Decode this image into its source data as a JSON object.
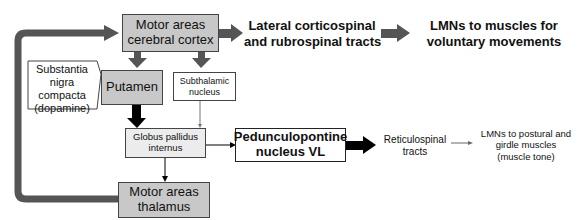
{
  "diagram": {
    "nodes": {
      "cortex": "Motor areas\ncerebral cortex",
      "lateral_tracts": "Lateral corticospinal\nand rubrospinal tracts",
      "lmn_voluntary": "LMNs to muscles for\nvoluntary movements",
      "substantia_nigra": "Substantia\nnigra\ncompacta\n(dopamine)",
      "putamen": "Putamen",
      "subthalamic": "Subthalamic\nnucleus",
      "globus_pallidus": "Globus pallidus\ninternus",
      "pedunculopontine": "Pedunculopontine\nnucleus VL",
      "reticulospinal": "Reticulospinal\ntracts",
      "lmn_postural": "LMNs to postural and\ngirdle muscles\n(muscle tone)",
      "thalamus": "Motor areas\nthalamus"
    },
    "colors": {
      "dark_box": "#c8c8c8",
      "light_box": "#ececec",
      "thick_arrow": "#555555",
      "black_arrow": "#000000"
    }
  }
}
